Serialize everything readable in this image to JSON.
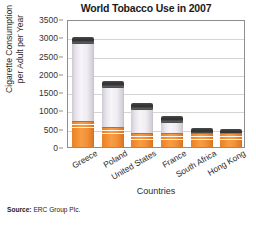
{
  "chart_data": {
    "type": "bar",
    "title": "World Tobacco Use in 2007",
    "xlabel": "Countries",
    "ylabel": "Cigarette Consumption per Adult per Year",
    "ylabel_line1": "Cigarette Consumption",
    "ylabel_line2": "per Adult per Year",
    "categories": [
      "Greece",
      "Poland",
      "United States",
      "France",
      "South Africa",
      "Hong Kong"
    ],
    "values": [
      3000,
      1800,
      1200,
      860,
      530,
      490
    ],
    "ylim": [
      0,
      3500
    ],
    "ytick_labels": [
      "0",
      "500",
      "1000",
      "1500",
      "2000",
      "2500",
      "3000",
      "3500"
    ],
    "ytick_values": [
      0,
      500,
      1000,
      1500,
      2000,
      2500,
      3000,
      3500
    ],
    "grid": true,
    "grid_axis": "y",
    "legend": false,
    "bar_style": "cigarette",
    "colors": {
      "filter": "#f2913a",
      "paper": "#f0edf3",
      "tip": "#2e2e2e",
      "gridline": "#d4d4d4",
      "axis": "#8d8d8d"
    }
  },
  "source": {
    "label": "Source:",
    "text": "ERC Group Plc."
  }
}
